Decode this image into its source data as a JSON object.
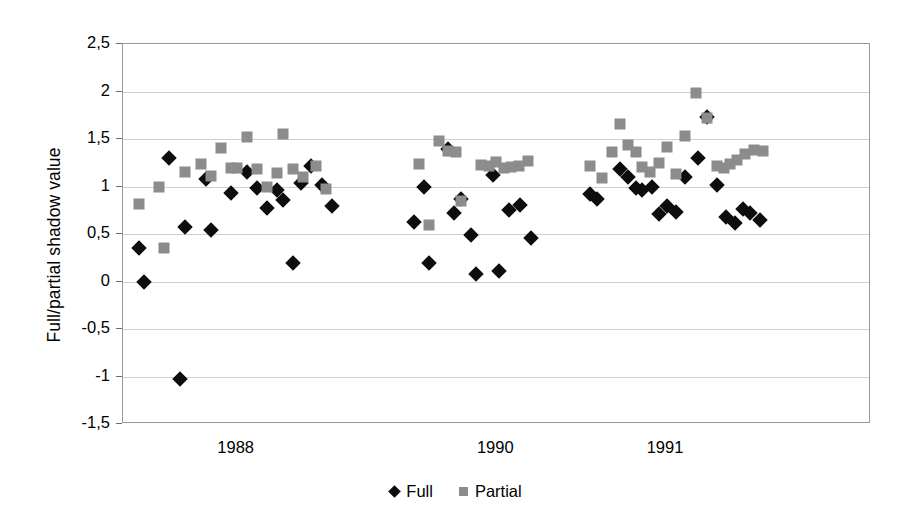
{
  "chart_data": {
    "type": "scatter",
    "title": "",
    "xlabel": "",
    "ylabel": "Full/partial shadow value",
    "ylim": [
      -1.5,
      2.5
    ],
    "yticks": [
      "-1,5",
      "-1",
      "-0,5",
      "0",
      "0,5",
      "1",
      "1,5",
      "2",
      "2,5"
    ],
    "ytick_values": [
      -1.5,
      -1,
      -0.5,
      0,
      0.5,
      1,
      1.5,
      2,
      2.5
    ],
    "xticks": [
      "1988",
      "1990",
      "1991"
    ],
    "xtick_positions": [
      0.152,
      0.499,
      0.726
    ],
    "grid": true,
    "legend_position": "bottom",
    "legend": [
      "Full",
      "Partial"
    ],
    "colors": {
      "full": "#0d0d0d",
      "partial": "#8c8c8c",
      "gridline": "#cfcfcf",
      "frame": "#9a9a9a"
    },
    "series": [
      {
        "name": "Full",
        "marker": "diamond",
        "points": [
          {
            "x": 0.021,
            "y": 0.35
          },
          {
            "x": 0.028,
            "y": 0.0
          },
          {
            "x": 0.062,
            "y": 1.3
          },
          {
            "x": 0.076,
            "y": -1.03
          },
          {
            "x": 0.083,
            "y": 0.57
          },
          {
            "x": 0.111,
            "y": 1.08
          },
          {
            "x": 0.118,
            "y": 0.54
          },
          {
            "x": 0.145,
            "y": 0.93
          },
          {
            "x": 0.166,
            "y": 1.15
          },
          {
            "x": 0.179,
            "y": 0.98
          },
          {
            "x": 0.193,
            "y": 0.77
          },
          {
            "x": 0.206,
            "y": 0.96
          },
          {
            "x": 0.214,
            "y": 0.86
          },
          {
            "x": 0.227,
            "y": 0.2
          },
          {
            "x": 0.238,
            "y": 1.04
          },
          {
            "x": 0.251,
            "y": 1.22
          },
          {
            "x": 0.266,
            "y": 1.02
          },
          {
            "x": 0.279,
            "y": 0.8
          },
          {
            "x": 0.389,
            "y": 0.63
          },
          {
            "x": 0.402,
            "y": 1.0
          },
          {
            "x": 0.409,
            "y": 0.2
          },
          {
            "x": 0.434,
            "y": 1.4
          },
          {
            "x": 0.442,
            "y": 0.72
          },
          {
            "x": 0.452,
            "y": 0.87
          },
          {
            "x": 0.465,
            "y": 0.49
          },
          {
            "x": 0.472,
            "y": 0.08
          },
          {
            "x": 0.494,
            "y": 1.12
          },
          {
            "x": 0.503,
            "y": 0.11
          },
          {
            "x": 0.516,
            "y": 0.75
          },
          {
            "x": 0.531,
            "y": 0.81
          },
          {
            "x": 0.545,
            "y": 0.46
          },
          {
            "x": 0.624,
            "y": 0.92
          },
          {
            "x": 0.634,
            "y": 0.87
          },
          {
            "x": 0.664,
            "y": 1.18
          },
          {
            "x": 0.675,
            "y": 1.1
          },
          {
            "x": 0.686,
            "y": 0.98
          },
          {
            "x": 0.694,
            "y": 0.96
          },
          {
            "x": 0.707,
            "y": 1.0
          },
          {
            "x": 0.716,
            "y": 0.71
          },
          {
            "x": 0.727,
            "y": 0.79
          },
          {
            "x": 0.739,
            "y": 0.73
          },
          {
            "x": 0.752,
            "y": 1.1
          },
          {
            "x": 0.769,
            "y": 1.3
          },
          {
            "x": 0.781,
            "y": 1.73
          },
          {
            "x": 0.794,
            "y": 1.02
          },
          {
            "x": 0.806,
            "y": 0.68
          },
          {
            "x": 0.818,
            "y": 0.62
          },
          {
            "x": 0.829,
            "y": 0.76
          },
          {
            "x": 0.838,
            "y": 0.72
          },
          {
            "x": 0.851,
            "y": 0.65
          }
        ]
      },
      {
        "name": "Partial",
        "marker": "square",
        "points": [
          {
            "x": 0.021,
            "y": 0.82
          },
          {
            "x": 0.048,
            "y": 1.0
          },
          {
            "x": 0.055,
            "y": 0.35
          },
          {
            "x": 0.083,
            "y": 1.15
          },
          {
            "x": 0.104,
            "y": 1.24
          },
          {
            "x": 0.118,
            "y": 1.11
          },
          {
            "x": 0.131,
            "y": 1.41
          },
          {
            "x": 0.145,
            "y": 1.2
          },
          {
            "x": 0.152,
            "y": 1.2
          },
          {
            "x": 0.166,
            "y": 1.52
          },
          {
            "x": 0.179,
            "y": 1.18
          },
          {
            "x": 0.193,
            "y": 1.0
          },
          {
            "x": 0.206,
            "y": 1.14
          },
          {
            "x": 0.214,
            "y": 1.55
          },
          {
            "x": 0.227,
            "y": 1.18
          },
          {
            "x": 0.241,
            "y": 1.1
          },
          {
            "x": 0.258,
            "y": 1.22
          },
          {
            "x": 0.272,
            "y": 0.97
          },
          {
            "x": 0.396,
            "y": 1.24
          },
          {
            "x": 0.409,
            "y": 0.59
          },
          {
            "x": 0.422,
            "y": 1.48
          },
          {
            "x": 0.434,
            "y": 1.37
          },
          {
            "x": 0.445,
            "y": 1.36
          },
          {
            "x": 0.452,
            "y": 0.85
          },
          {
            "x": 0.479,
            "y": 1.23
          },
          {
            "x": 0.489,
            "y": 1.22
          },
          {
            "x": 0.499,
            "y": 1.26
          },
          {
            "x": 0.509,
            "y": 1.2
          },
          {
            "x": 0.519,
            "y": 1.21
          },
          {
            "x": 0.529,
            "y": 1.22
          },
          {
            "x": 0.541,
            "y": 1.27
          },
          {
            "x": 0.624,
            "y": 1.22
          },
          {
            "x": 0.641,
            "y": 1.09
          },
          {
            "x": 0.654,
            "y": 1.36
          },
          {
            "x": 0.664,
            "y": 1.66
          },
          {
            "x": 0.675,
            "y": 1.44
          },
          {
            "x": 0.686,
            "y": 1.36
          },
          {
            "x": 0.694,
            "y": 1.21
          },
          {
            "x": 0.704,
            "y": 1.15
          },
          {
            "x": 0.716,
            "y": 1.25
          },
          {
            "x": 0.727,
            "y": 1.42
          },
          {
            "x": 0.739,
            "y": 1.13
          },
          {
            "x": 0.752,
            "y": 1.53
          },
          {
            "x": 0.766,
            "y": 1.98
          },
          {
            "x": 0.781,
            "y": 1.72
          },
          {
            "x": 0.794,
            "y": 1.22
          },
          {
            "x": 0.803,
            "y": 1.2
          },
          {
            "x": 0.812,
            "y": 1.24
          },
          {
            "x": 0.821,
            "y": 1.28
          },
          {
            "x": 0.832,
            "y": 1.34
          },
          {
            "x": 0.844,
            "y": 1.38
          },
          {
            "x": 0.856,
            "y": 1.37
          }
        ]
      }
    ]
  }
}
